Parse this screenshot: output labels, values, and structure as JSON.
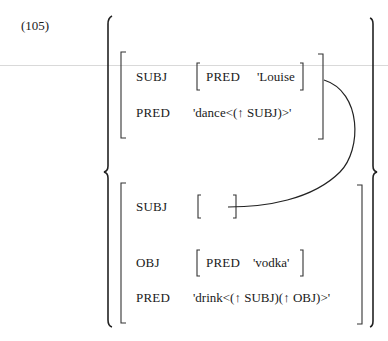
{
  "example_number": "(105)",
  "upper_fstructure": {
    "subj_label": "SUBJ",
    "subj_pred_label": "PRED",
    "subj_pred_value": "'Louise",
    "pred_label": "PRED",
    "pred_value": "'dance<(↑ SUBJ)>'"
  },
  "lower_fstructure": {
    "subj_label": "SUBJ",
    "obj_label": "OBJ",
    "obj_pred_label": "PRED",
    "obj_pred_value": "'vodka'",
    "pred_label": "PRED",
    "pred_value": "'drink<(↑ SUBJ)(↑ OBJ)>'"
  },
  "connector": "shared SUBJ arc from upper SUBJ value to lower empty SUBJ bracket"
}
